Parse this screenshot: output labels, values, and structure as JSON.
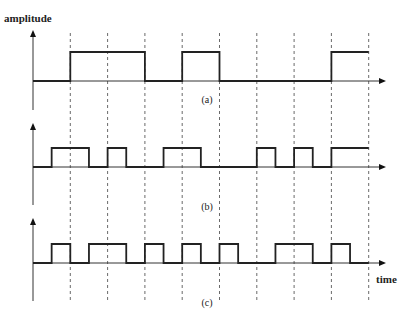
{
  "axis_labels": {
    "y": "amplitude",
    "x": "time"
  },
  "grid_boundaries": 9,
  "signals": [
    {
      "id": "a",
      "caption": "(a)",
      "description": "NRZ signal, one level per bit interval",
      "levels": [
        0,
        1,
        1,
        0,
        1,
        0,
        0,
        0,
        1
      ],
      "resolution": "full-bit"
    },
    {
      "id": "b",
      "caption": "(b)",
      "description": "half-bit resolution waveform",
      "levels": [
        0,
        1,
        1,
        0,
        1,
        0,
        0,
        1,
        1,
        0,
        0,
        0,
        1,
        0,
        1,
        0,
        1,
        1
      ],
      "resolution": "half-bit"
    },
    {
      "id": "c",
      "caption": "(c)",
      "description": "half-bit resolution waveform",
      "levels": [
        0,
        1,
        0,
        1,
        1,
        0,
        1,
        0,
        1,
        0,
        1,
        0,
        0,
        1,
        1,
        0,
        1,
        0
      ],
      "resolution": "half-bit"
    }
  ]
}
